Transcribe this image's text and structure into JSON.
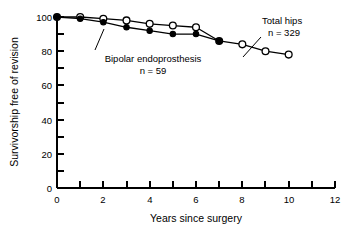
{
  "chart_data": {
    "type": "line",
    "title": "",
    "subtitle": "",
    "xlabel": "Years since surgery",
    "ylabel": "Survivorship free of revision",
    "xlim": [
      0,
      12
    ],
    "ylim": [
      0,
      100
    ],
    "x_ticks_major": [
      0,
      2,
      4,
      6,
      8,
      10,
      12
    ],
    "x_ticks_minor": [
      1,
      3,
      5,
      7,
      9,
      11
    ],
    "x_tick_labels": [
      "0",
      "2",
      "4",
      "6",
      "8",
      "10",
      "12"
    ],
    "y_ticks_major": [
      0,
      20,
      40,
      60,
      80,
      100
    ],
    "y_ticks_minor": [
      10,
      30,
      50,
      70,
      90
    ],
    "y_tick_labels": [
      "0",
      "20",
      "40",
      "60",
      "80",
      "100"
    ],
    "grid": false,
    "legend_position": "inline-annotations",
    "series": [
      {
        "name": "Total hips",
        "marker": "open-circle",
        "n": 329,
        "x": [
          0,
          1,
          2,
          3,
          4,
          5,
          6,
          7,
          8,
          9,
          10
        ],
        "values": [
          100,
          100,
          99,
          98,
          96,
          95,
          94,
          86,
          84,
          80,
          78
        ]
      },
      {
        "name": "Bipolar endoprosthesis",
        "marker": "filled-circle",
        "n": 59,
        "x": [
          0,
          1,
          2,
          3,
          4,
          5,
          6,
          7
        ],
        "values": [
          100,
          99,
          97,
          94,
          92,
          90,
          90,
          86
        ]
      }
    ],
    "annotations": [
      {
        "id": "total-hips",
        "line1": "Total hips",
        "line2": "n = 329",
        "leader_to_series": "Total hips",
        "leader_to_x": 8
      },
      {
        "id": "bipolar-endoprosthesis",
        "line1": "Bipolar endoprosthesis",
        "line2": "n = 59",
        "leader_to_series": "Bipolar endoprosthesis",
        "leader_to_x": 2
      }
    ]
  }
}
